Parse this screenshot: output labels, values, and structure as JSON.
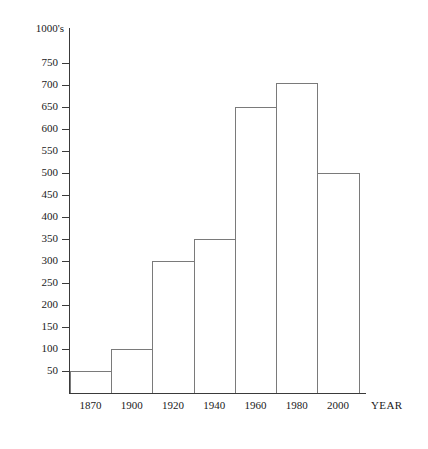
{
  "chart_data": {
    "type": "bar",
    "title": "",
    "xlabel": "YEAR",
    "ylabel": "1000's",
    "categories": [
      "1870",
      "1900",
      "1920",
      "1940",
      "1960",
      "1980",
      "2000"
    ],
    "values": [
      50,
      100,
      300,
      350,
      650,
      705,
      500
    ],
    "ylim": [
      0,
      775
    ],
    "ytick_labels": [
      "750",
      "700",
      "650",
      "600",
      "550",
      "500",
      "450",
      "400",
      "350",
      "300",
      "250",
      "200",
      "150",
      "100",
      "50"
    ],
    "ytick_values": [
      750,
      700,
      650,
      600,
      550,
      500,
      450,
      400,
      350,
      300,
      250,
      200,
      150,
      100,
      50
    ],
    "grid": false,
    "legend": false,
    "bar_style": {
      "fill": "#ffffff",
      "outline": "#7a7a7a",
      "contiguous": true
    },
    "axis_color": "#3a3a3a"
  }
}
